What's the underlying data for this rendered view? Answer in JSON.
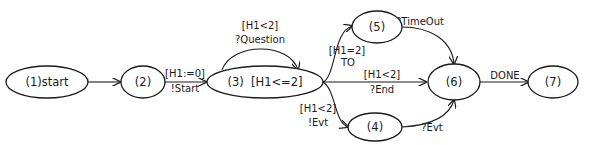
{
  "diagram": {
    "type": "state-machine",
    "nodes": [
      {
        "id": "n1",
        "label": "(1)start"
      },
      {
        "id": "n2",
        "label": "(2)"
      },
      {
        "id": "n3",
        "label": "(3)  [H1<=2]"
      },
      {
        "id": "n4",
        "label": "(4)"
      },
      {
        "id": "n5",
        "label": "(5)"
      },
      {
        "id": "n6",
        "label": "(6)"
      },
      {
        "id": "n7",
        "label": "(7)"
      }
    ],
    "edges": [
      {
        "from": "n1",
        "to": "n2",
        "guard": "",
        "action": ""
      },
      {
        "from": "n2",
        "to": "n3",
        "guard": "[H1:=0]",
        "action": "!Start"
      },
      {
        "from": "n3",
        "to": "n3",
        "guard": "[H1<2]",
        "action": "?Question"
      },
      {
        "from": "n3",
        "to": "n5",
        "guard": "[H1=2]",
        "action": "TO"
      },
      {
        "from": "n3",
        "to": "n6",
        "guard": "[H1<2]",
        "action": "?End"
      },
      {
        "from": "n3",
        "to": "n4",
        "guard": "[H1<2]",
        "action": "!Evt"
      },
      {
        "from": "n5",
        "to": "n6",
        "guard": "",
        "action": "?TimeOut"
      },
      {
        "from": "n4",
        "to": "n6",
        "guard": "",
        "action": "?Evt"
      },
      {
        "from": "n6",
        "to": "n7",
        "guard": "",
        "action": "DONE"
      }
    ]
  }
}
